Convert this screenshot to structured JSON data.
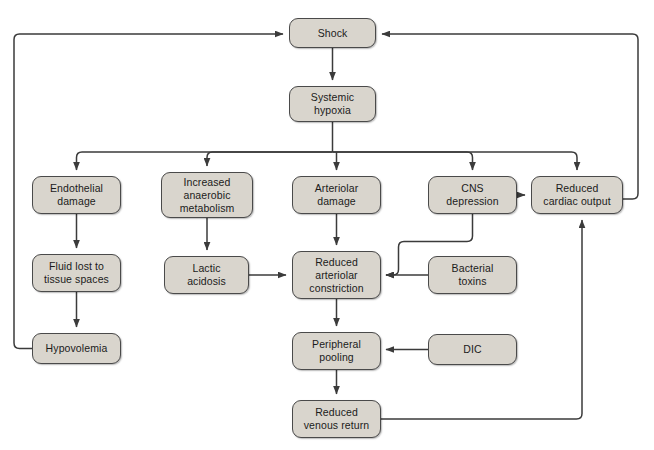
{
  "diagram": {
    "type": "flowchart",
    "colors": {
      "node_fill": "#d9d5cd",
      "node_border": "#4a4a4a",
      "edge": "#3b3b3b",
      "background": "#ffffff",
      "text": "#1b1b1b"
    },
    "nodes": [
      {
        "id": "shock",
        "label": "Shock",
        "x": 289,
        "y": 18,
        "w": 87,
        "h": 30
      },
      {
        "id": "systemic-hypoxia",
        "label": "Systemic\nhypoxia",
        "x": 289,
        "y": 86,
        "w": 87,
        "h": 36
      },
      {
        "id": "endothelial-damage",
        "label": "Endothelial\ndamage",
        "x": 32,
        "y": 176,
        "w": 89,
        "h": 38
      },
      {
        "id": "increased-anaerobic",
        "label": "Increased\nanaerobic\nmetabolism",
        "x": 161,
        "y": 172,
        "w": 92,
        "h": 46
      },
      {
        "id": "arteriolar-damage",
        "label": "Arteriolar\ndamage",
        "x": 292,
        "y": 176,
        "w": 89,
        "h": 38
      },
      {
        "id": "cns-depression",
        "label": "CNS\ndepression",
        "x": 428,
        "y": 176,
        "w": 89,
        "h": 38
      },
      {
        "id": "reduced-cardiac-output",
        "label": "Reduced\ncardiac output",
        "x": 531,
        "y": 176,
        "w": 92,
        "h": 38
      },
      {
        "id": "fluid-lost",
        "label": "Fluid lost to\ntissue spaces",
        "x": 32,
        "y": 254,
        "w": 89,
        "h": 38
      },
      {
        "id": "lactic-acidosis",
        "label": "Lactic\nacidosis",
        "x": 164,
        "y": 256,
        "w": 85,
        "h": 38
      },
      {
        "id": "reduced-arteriolar",
        "label": "Reduced\narteriolar\nconstriction",
        "x": 292,
        "y": 251,
        "w": 89,
        "h": 48
      },
      {
        "id": "bacterial-toxins",
        "label": "Bacterial\ntoxins",
        "x": 428,
        "y": 256,
        "w": 89,
        "h": 38
      },
      {
        "id": "hypovolemia",
        "label": "Hypovolemia",
        "x": 32,
        "y": 333,
        "w": 89,
        "h": 31
      },
      {
        "id": "peripheral-pooling",
        "label": "Peripheral\npooling",
        "x": 292,
        "y": 332,
        "w": 89,
        "h": 38
      },
      {
        "id": "dic",
        "label": "DIC",
        "x": 428,
        "y": 334,
        "w": 89,
        "h": 31
      },
      {
        "id": "reduced-venous-return",
        "label": "Reduced\nvenous return",
        "x": 292,
        "y": 400,
        "w": 89,
        "h": 38
      }
    ],
    "edges": [
      {
        "id": "shock-to-systemic-hypoxia",
        "from": "shock",
        "to": "systemic-hypoxia"
      },
      {
        "id": "systemic-hypoxia-to-endothelial-damage",
        "from": "systemic-hypoxia",
        "to": "endothelial-damage"
      },
      {
        "id": "systemic-hypoxia-to-increased-anaerobic",
        "from": "systemic-hypoxia",
        "to": "increased-anaerobic"
      },
      {
        "id": "systemic-hypoxia-to-arteriolar-damage",
        "from": "systemic-hypoxia",
        "to": "arteriolar-damage"
      },
      {
        "id": "systemic-hypoxia-to-cns-depression",
        "from": "systemic-hypoxia",
        "to": "cns-depression"
      },
      {
        "id": "systemic-hypoxia-to-reduced-cardiac",
        "from": "systemic-hypoxia",
        "to": "reduced-cardiac-output"
      },
      {
        "id": "endothelial-damage-to-fluid-lost",
        "from": "endothelial-damage",
        "to": "fluid-lost"
      },
      {
        "id": "fluid-lost-to-hypovolemia",
        "from": "fluid-lost",
        "to": "hypovolemia"
      },
      {
        "id": "hypovolemia-to-shock",
        "from": "hypovolemia",
        "to": "shock"
      },
      {
        "id": "increased-anaerobic-to-lactic-acidosis",
        "from": "increased-anaerobic",
        "to": "lactic-acidosis"
      },
      {
        "id": "lactic-acidosis-to-reduced-arteriolar",
        "from": "lactic-acidosis",
        "to": "reduced-arteriolar"
      },
      {
        "id": "arteriolar-damage-to-reduced-arteriolar",
        "from": "arteriolar-damage",
        "to": "reduced-arteriolar"
      },
      {
        "id": "cns-depression-to-reduced-cardiac",
        "from": "cns-depression",
        "to": "reduced-cardiac-output"
      },
      {
        "id": "cns-depression-to-reduced-arteriolar",
        "from": "cns-depression",
        "to": "reduced-arteriolar"
      },
      {
        "id": "bacterial-toxins-to-reduced-arteriolar",
        "from": "bacterial-toxins",
        "to": "reduced-arteriolar"
      },
      {
        "id": "reduced-arteriolar-to-peripheral",
        "from": "reduced-arteriolar",
        "to": "peripheral-pooling"
      },
      {
        "id": "dic-to-peripheral-pooling",
        "from": "dic",
        "to": "peripheral-pooling"
      },
      {
        "id": "peripheral-pooling-to-venous-return",
        "from": "peripheral-pooling",
        "to": "reduced-venous-return"
      },
      {
        "id": "venous-return-to-reduced-cardiac",
        "from": "reduced-venous-return",
        "to": "reduced-cardiac-output"
      },
      {
        "id": "reduced-cardiac-to-shock",
        "from": "reduced-cardiac-output",
        "to": "shock"
      }
    ]
  }
}
